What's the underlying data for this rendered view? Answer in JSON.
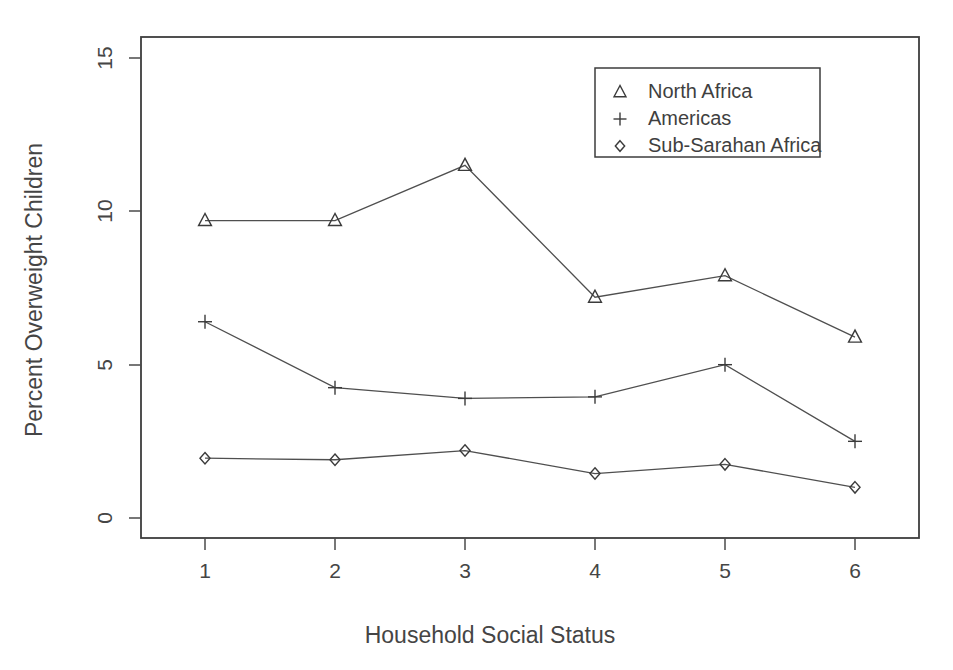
{
  "figure": {
    "cut_off_top_text": "",
    "background_color": "#ffffff",
    "ink_color": "#454545"
  },
  "axes": {
    "x_title": "Household Social Status",
    "y_title": "Percent Overweight Children",
    "x_tick_labels": [
      "1",
      "2",
      "3",
      "4",
      "5",
      "6"
    ],
    "y_tick_labels": [
      "0",
      "5",
      "10",
      "15"
    ]
  },
  "legend": {
    "position": "top-right-inside",
    "entries": [
      {
        "label": "North Africa",
        "marker": "triangle-up-marker"
      },
      {
        "label": "Americas",
        "marker": "plus-marker"
      },
      {
        "label": "Sub-Sarahan Africa",
        "marker": "diamond-marker"
      }
    ]
  },
  "chart_data": {
    "type": "line",
    "title": "",
    "xlabel": "Household Social Status",
    "ylabel": "Percent Overweight Children",
    "x": [
      1,
      2,
      3,
      4,
      5,
      6
    ],
    "xlim": [
      0.6,
      6.4
    ],
    "ylim": [
      0,
      15.7
    ],
    "xticks": [
      1,
      2,
      3,
      4,
      5,
      6
    ],
    "yticks": [
      0,
      5,
      10,
      15
    ],
    "grid": false,
    "legend_position": "upper right",
    "series": [
      {
        "name": "North Africa",
        "marker": "triangle",
        "values": [
          9.7,
          9.7,
          11.5,
          7.2,
          7.9,
          5.9
        ]
      },
      {
        "name": "Americas",
        "marker": "plus",
        "values": [
          6.4,
          4.25,
          3.9,
          3.95,
          5.0,
          2.5
        ]
      },
      {
        "name": "Sub-Sarahan Africa",
        "marker": "diamond",
        "values": [
          1.95,
          1.9,
          2.2,
          1.45,
          1.75,
          1.0
        ]
      }
    ]
  }
}
